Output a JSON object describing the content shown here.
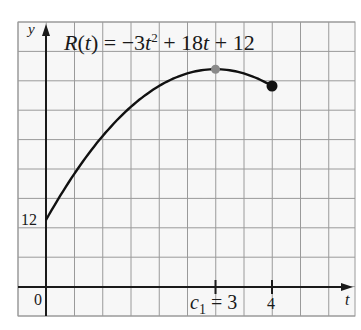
{
  "chart_data": {
    "type": "line",
    "xlabel": "t",
    "ylabel": "y",
    "function": "R(t) = -3t^2 + 18t + 12",
    "domain": [
      0,
      4
    ],
    "x": [
      0,
      0.5,
      1,
      1.5,
      2,
      2.5,
      3,
      3.5,
      4
    ],
    "series": [
      {
        "name": "R(t)",
        "values": [
          12,
          20.25,
          27,
          32.25,
          36,
          38.25,
          39,
          38.25,
          36
        ]
      }
    ],
    "points": [
      {
        "name": "maximum",
        "t": 3,
        "y": 39,
        "color": "#8a8a8a"
      },
      {
        "name": "endpoint",
        "t": 4,
        "y": 36,
        "color": "#111111"
      }
    ],
    "x_ticks": [
      {
        "value": 3,
        "label": "c₁ = 3"
      },
      {
        "value": 4,
        "label": "4"
      }
    ],
    "y_ticks": [
      {
        "value": 12,
        "label": "12"
      }
    ],
    "origin_label": "0",
    "grid": true,
    "xlim": [
      -0.5,
      5.5
    ],
    "ylim": [
      -5.2,
      47.5
    ]
  },
  "labels": {
    "title_prefix": "R(t) = −3t",
    "title_exp": "2",
    "title_suffix": " + 18t + 12",
    "y_axis": "y",
    "t_axis": "t",
    "origin": "0",
    "y_tick_12": "12",
    "c1_base": "c",
    "c1_sub": "1",
    "c1_rest": " = 3",
    "t_tick_4": "4"
  },
  "colors": {
    "grid": "#9a9a9a",
    "axis": "#1a1a1a",
    "curve": "#111111",
    "max_point": "#8a8a8a",
    "end_point": "#111111"
  }
}
